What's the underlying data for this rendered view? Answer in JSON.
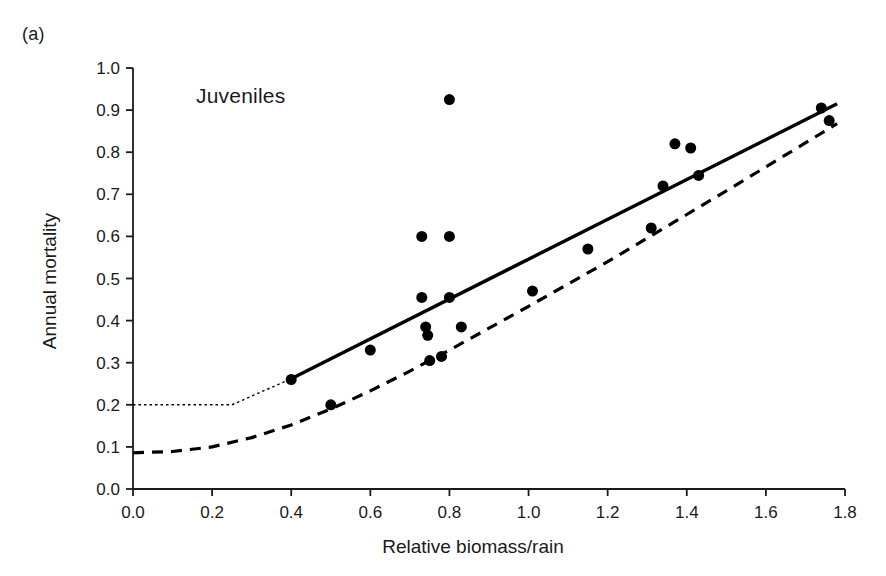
{
  "figure": {
    "panel_label": "(a)",
    "annotation": "Juveniles"
  },
  "chart_data": {
    "type": "scatter",
    "title": "",
    "subtitle": "",
    "panel": "(a)",
    "annotation": "Juveniles",
    "xlabel": "Relative biomass/rain",
    "ylabel": "Annual mortality",
    "xlim": [
      0.0,
      1.8
    ],
    "ylim": [
      0.0,
      1.0
    ],
    "xticks": [
      0.0,
      0.2,
      0.4,
      0.6,
      0.8,
      1.0,
      1.2,
      1.4,
      1.6,
      1.8
    ],
    "xtick_labels": [
      "0.0",
      "0.2",
      "0.4",
      "0.6",
      "0.8",
      "1.0",
      "1.2",
      "1.4",
      "1.6",
      "1.8"
    ],
    "yticks": [
      0.0,
      0.1,
      0.2,
      0.3,
      0.4,
      0.5,
      0.6,
      0.7,
      0.8,
      0.9,
      1.0
    ],
    "ytick_labels": [
      "0.0",
      "0.1",
      "0.2",
      "0.3",
      "0.4",
      "0.5",
      "0.6",
      "0.7",
      "0.8",
      "0.9",
      "1.0"
    ],
    "grid": false,
    "legend": "none",
    "marker": {
      "shape": "circle",
      "color": "#000000",
      "size": 11
    },
    "points": [
      {
        "x": 0.4,
        "y": 0.26
      },
      {
        "x": 0.5,
        "y": 0.2
      },
      {
        "x": 0.6,
        "y": 0.33
      },
      {
        "x": 0.73,
        "y": 0.6
      },
      {
        "x": 0.73,
        "y": 0.455
      },
      {
        "x": 0.74,
        "y": 0.385
      },
      {
        "x": 0.745,
        "y": 0.365
      },
      {
        "x": 0.75,
        "y": 0.305
      },
      {
        "x": 0.78,
        "y": 0.315
      },
      {
        "x": 0.8,
        "y": 0.925
      },
      {
        "x": 0.8,
        "y": 0.6
      },
      {
        "x": 0.8,
        "y": 0.455
      },
      {
        "x": 0.83,
        "y": 0.385
      },
      {
        "x": 1.01,
        "y": 0.47
      },
      {
        "x": 1.15,
        "y": 0.57
      },
      {
        "x": 1.31,
        "y": 0.62
      },
      {
        "x": 1.34,
        "y": 0.72
      },
      {
        "x": 1.37,
        "y": 0.82
      },
      {
        "x": 1.41,
        "y": 0.81
      },
      {
        "x": 1.43,
        "y": 0.745
      },
      {
        "x": 1.74,
        "y": 0.905
      },
      {
        "x": 1.76,
        "y": 0.875
      }
    ],
    "series": [
      {
        "name": "linear-fit-solid",
        "style": "solid",
        "color": "#000000",
        "width": 3.4,
        "points": [
          {
            "x": 0.4,
            "y": 0.262
          },
          {
            "x": 1.78,
            "y": 0.915
          }
        ]
      },
      {
        "name": "linear-fit-extrapolation-dotted",
        "style": "dotted",
        "color": "#000000",
        "width": 1.4,
        "points": [
          {
            "x": 0.0,
            "y": 0.2
          },
          {
            "x": 0.25,
            "y": 0.2
          },
          {
            "x": 0.4,
            "y": 0.262
          }
        ]
      },
      {
        "name": "curve-fit-dashed",
        "style": "dashed",
        "color": "#000000",
        "width": 3.2,
        "points": [
          {
            "x": 0.0,
            "y": 0.086
          },
          {
            "x": 0.1,
            "y": 0.089
          },
          {
            "x": 0.2,
            "y": 0.1
          },
          {
            "x": 0.3,
            "y": 0.122
          },
          {
            "x": 0.4,
            "y": 0.152
          },
          {
            "x": 0.5,
            "y": 0.19
          },
          {
            "x": 0.6,
            "y": 0.233
          },
          {
            "x": 0.7,
            "y": 0.28
          },
          {
            "x": 0.8,
            "y": 0.33
          },
          {
            "x": 0.9,
            "y": 0.382
          },
          {
            "x": 1.0,
            "y": 0.434
          },
          {
            "x": 1.1,
            "y": 0.487
          },
          {
            "x": 1.2,
            "y": 0.54
          },
          {
            "x": 1.3,
            "y": 0.596
          },
          {
            "x": 1.4,
            "y": 0.652
          },
          {
            "x": 1.5,
            "y": 0.708
          },
          {
            "x": 1.6,
            "y": 0.765
          },
          {
            "x": 1.7,
            "y": 0.822
          },
          {
            "x": 1.78,
            "y": 0.868
          }
        ]
      }
    ]
  }
}
